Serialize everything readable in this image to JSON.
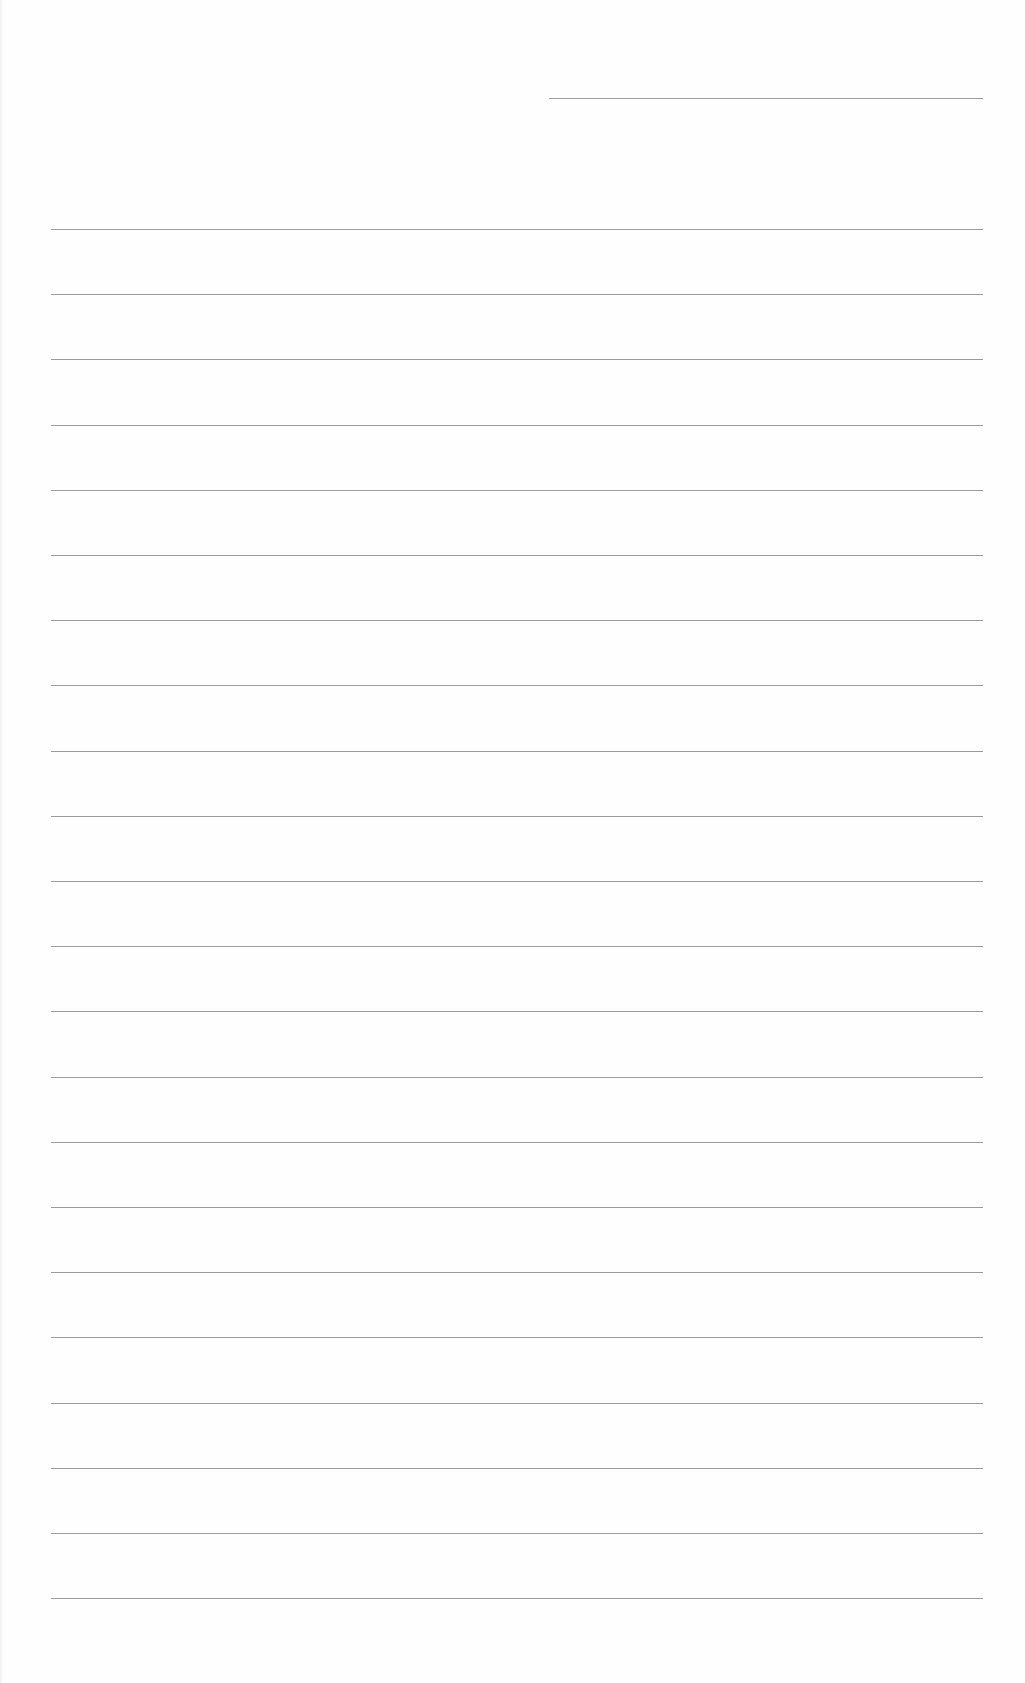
{
  "document": {
    "type": "ruled-paper",
    "header_line": {
      "present": true
    },
    "line_count": 22,
    "line_color": "#8a8a8a",
    "background": "#fefefe"
  }
}
